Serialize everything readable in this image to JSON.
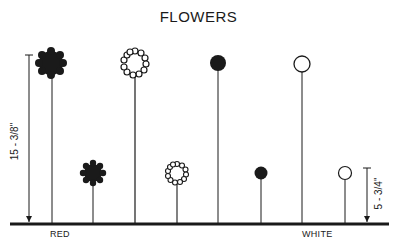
{
  "title": "FLOWERS",
  "ground_labels": {
    "left": "RED",
    "right": "WHITE"
  },
  "dimensions": {
    "tall": "15 - 3/8\"",
    "short": "5 - 3/4\""
  },
  "colors": {
    "ink": "#1a1a1a",
    "background": "#ffffff"
  },
  "flowers": [
    {
      "id": 1,
      "style": "dense-cluster-filled",
      "height": "tall",
      "color": "red"
    },
    {
      "id": 2,
      "style": "dense-cluster-filled",
      "height": "short",
      "color": "red"
    },
    {
      "id": 3,
      "style": "ring-of-beads",
      "height": "tall",
      "color": "white"
    },
    {
      "id": 4,
      "style": "ring-of-beads",
      "height": "short",
      "color": "white"
    },
    {
      "id": 5,
      "style": "solid-dot",
      "height": "tall",
      "color": "red"
    },
    {
      "id": 6,
      "style": "solid-dot",
      "height": "short",
      "color": "red"
    },
    {
      "id": 7,
      "style": "open-circle",
      "height": "tall",
      "color": "white"
    },
    {
      "id": 8,
      "style": "open-circle",
      "height": "short",
      "color": "white"
    }
  ]
}
